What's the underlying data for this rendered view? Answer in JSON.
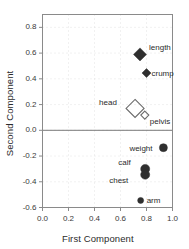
{
  "chart_data": {
    "type": "scatter",
    "title": "",
    "xlabel": "First Component",
    "ylabel": "Second Component",
    "xlim": [
      0.0,
      1.0
    ],
    "ylim": [
      -0.6,
      0.9
    ],
    "xticks": [
      "0.0",
      "0.2",
      "0.4",
      "0.6",
      "0.8",
      "1.0"
    ],
    "xtick_values": [
      0.0,
      0.2,
      0.4,
      0.6,
      0.8,
      1.0
    ],
    "yticks": [
      "0.8",
      "0.6",
      "0.4",
      "0.2",
      "0.0",
      "-0.2",
      "-0.4",
      "-0.6"
    ],
    "ytick_values": [
      0.8,
      0.6,
      0.4,
      0.2,
      0.0,
      -0.2,
      -0.4,
      -0.6
    ],
    "grid": "dotted",
    "legend": "none",
    "zero_line": 0.0,
    "points": [
      {
        "label": "length",
        "x": 0.75,
        "y": 0.59,
        "marker": "diamond",
        "filled": true,
        "size": 13,
        "label_dx": 9,
        "label_dy": -11
      },
      {
        "label": "crump",
        "x": 0.8,
        "y": 0.445,
        "marker": "diamond",
        "filled": true,
        "size": 9,
        "label_dx": 5,
        "label_dy": -4
      },
      {
        "label": "head",
        "x": 0.712,
        "y": 0.17,
        "marker": "diamond",
        "filled": false,
        "size": 18,
        "label_dx": -36,
        "label_dy": -10
      },
      {
        "label": "pelvis",
        "x": 0.787,
        "y": 0.118,
        "marker": "diamond",
        "filled": false,
        "size": 8,
        "label_dx": 5,
        "label_dy": 2
      },
      {
        "label": "weight",
        "x": 0.93,
        "y": -0.135,
        "marker": "circle",
        "filled": true,
        "size": 8,
        "label_dx": -34,
        "label_dy": -4
      },
      {
        "label": "calf",
        "x": 0.79,
        "y": -0.3,
        "marker": "circle",
        "filled": true,
        "size": 9,
        "label_dx": -27,
        "label_dy": -11
      },
      {
        "label": "chest",
        "x": 0.79,
        "y": -0.345,
        "marker": "circle",
        "filled": true,
        "size": 9,
        "label_dx": -36,
        "label_dy": 1
      },
      {
        "label": "arm",
        "x": 0.755,
        "y": -0.545,
        "marker": "circle",
        "filled": true,
        "size": 6,
        "label_dx": 6,
        "label_dy": -4
      }
    ]
  },
  "style": {
    "frame_color": "#8a8a8a",
    "grid_color": "#d9d9d9",
    "marker_fill": "#2f2f2f",
    "marker_open_stroke": "#6a6a6a",
    "zero_line_color": "#7a7a7a",
    "text_color": "#2b2b2b",
    "background": "#ffffff"
  }
}
